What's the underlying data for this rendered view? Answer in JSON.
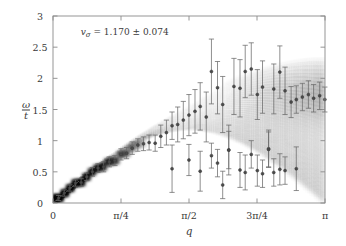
{
  "figure": {
    "annotation": "vσ = 1.170 ± 0.074",
    "annotation_symbol": "v",
    "annotation_sub": "σ",
    "annotation_value": "= 1.170 ± 0.074",
    "frame_color": "#8a8a8a",
    "marker_color": "#6a6a6a",
    "density_color": "#000000",
    "fit_line_color": "#555555"
  },
  "axes": {
    "x": {
      "label": "q",
      "min": 0,
      "max": 3.14159265,
      "tick_values": [
        0,
        0.78539816,
        1.57079633,
        2.35619449,
        3.14159265
      ],
      "tick_labels": [
        "0",
        "π/4",
        "π/2",
        "3π/4",
        "π"
      ]
    },
    "y": {
      "label": "ω/t",
      "label_num": "ω",
      "label_den": "t",
      "min": 0,
      "max": 3,
      "tick_values": [
        0,
        0.5,
        1,
        1.5,
        2,
        2.5,
        3
      ],
      "tick_labels": [
        "0",
        "0.5",
        "1",
        "1.5",
        "2",
        "2.5",
        "3"
      ]
    }
  },
  "chart_data": {
    "type": "scatter",
    "title": "",
    "xlabel": "q",
    "ylabel": "ω/t",
    "xlim": [
      0,
      3.14159265
    ],
    "ylim": [
      0,
      3
    ],
    "xtick_labels": [
      "0",
      "π/4",
      "π/2",
      "3π/4",
      "π"
    ],
    "xtick_values": [
      0,
      0.78539816,
      1.57079633,
      2.35619449,
      3.14159265
    ],
    "ytick_labels": [
      "0",
      "0.5",
      "1",
      "1.5",
      "2",
      "2.5",
      "3"
    ],
    "ytick_values": [
      0,
      0.5,
      1,
      1.5,
      2,
      2.5,
      3
    ],
    "grid": false,
    "legend": null,
    "annotations": [
      {
        "text": "vσ = 1.170 ± 0.074",
        "x": 0.32,
        "y": 2.72
      }
    ],
    "fit_line": {
      "slope": 1.17,
      "slope_err": 0.074,
      "intercept": 0,
      "x_range": [
        0,
        0.3
      ],
      "label": "spinon velocity fit"
    },
    "series": [
      {
        "name": "upper branch",
        "x": [
          0.065,
          0.13,
          0.195,
          0.26,
          0.325,
          0.39,
          0.455,
          0.52,
          0.585,
          0.65,
          0.715,
          0.785,
          0.85,
          0.915,
          0.98,
          1.045,
          1.11,
          1.18,
          1.245,
          1.31,
          1.375,
          1.44,
          1.505,
          1.57,
          1.64,
          1.7,
          1.77,
          1.83,
          1.9,
          1.96,
          2.03,
          2.09,
          2.16,
          2.22,
          2.29,
          2.36,
          2.42,
          2.49,
          2.55,
          2.62,
          2.68,
          2.75,
          2.81,
          2.88,
          2.95,
          3.01,
          3.08,
          3.14
        ],
        "y": [
          0.08,
          0.16,
          0.24,
          0.32,
          0.33,
          0.42,
          0.5,
          0.56,
          0.58,
          0.66,
          0.68,
          0.78,
          0.8,
          0.88,
          0.93,
          0.95,
          0.97,
          0.96,
          1.07,
          1.13,
          1.24,
          1.26,
          1.33,
          1.41,
          1.47,
          1.55,
          1.38,
          2.11,
          1.85,
          1.58,
          0.85,
          1.87,
          1.84,
          2.11,
          2.15,
          1.74,
          1.86,
          0.87,
          1.83,
          2.1,
          1.8,
          1.62,
          1.66,
          1.7,
          1.74,
          1.68,
          1.72,
          1.66
        ],
        "yerr": [
          0.04,
          0.05,
          0.05,
          0.05,
          0.06,
          0.06,
          0.07,
          0.07,
          0.08,
          0.08,
          0.08,
          0.09,
          0.09,
          0.1,
          0.1,
          0.11,
          0.12,
          0.13,
          0.18,
          0.2,
          0.22,
          0.28,
          0.3,
          0.33,
          0.35,
          0.38,
          0.4,
          0.52,
          0.42,
          0.45,
          0.4,
          0.45,
          0.46,
          0.42,
          0.42,
          0.4,
          0.42,
          0.3,
          0.4,
          0.42,
          0.38,
          0.25,
          0.22,
          0.22,
          0.22,
          0.22,
          0.22,
          0.2
        ]
      },
      {
        "name": "lower branch",
        "x": [
          1.375,
          1.57,
          1.7,
          1.83,
          1.9,
          1.96,
          2.03,
          2.16,
          2.22,
          2.29,
          2.36,
          2.42,
          2.49,
          2.55,
          2.62,
          2.68,
          2.81
        ],
        "y": [
          0.55,
          0.69,
          0.51,
          0.76,
          0.64,
          0.29,
          0.85,
          0.53,
          0.49,
          0.78,
          0.52,
          0.47,
          0.86,
          0.49,
          0.54,
          0.52,
          0.55
        ],
        "yerr": [
          0.38,
          0.25,
          0.32,
          0.2,
          0.22,
          0.22,
          0.3,
          0.28,
          0.28,
          0.22,
          0.25,
          0.22,
          0.28,
          0.22,
          0.25,
          0.22,
          0.35
        ]
      }
    ],
    "density": {
      "description": "grayscale spectral weight density, darker = higher intensity",
      "columns": 48,
      "notes": "sharp dark band following linear dispersion for q < pi/4, broadening into a continuum for larger q with a dark concentration near omega/t = 1.6-1.8 at large q"
    }
  }
}
